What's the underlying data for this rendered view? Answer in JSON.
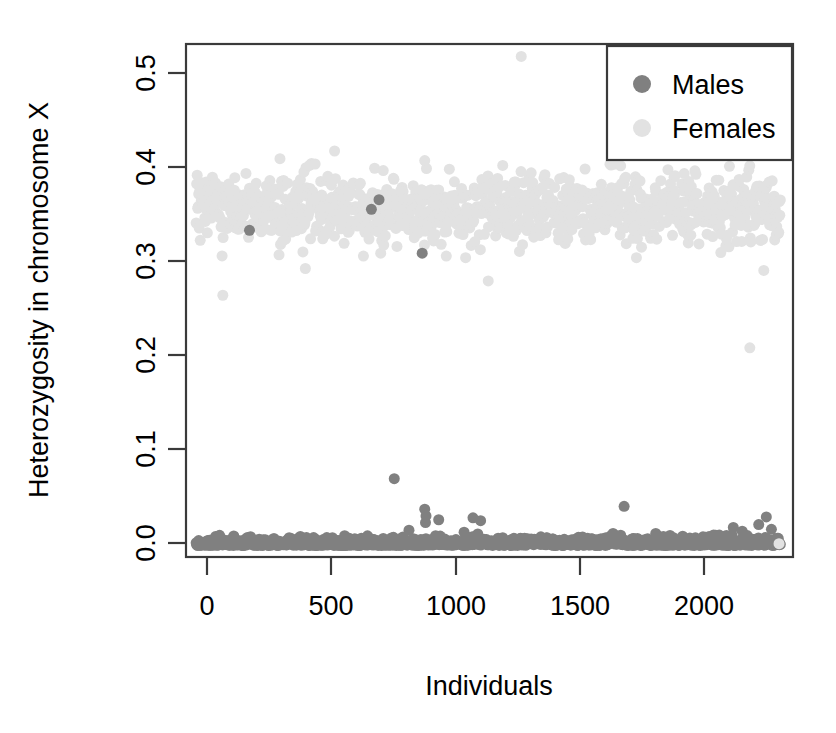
{
  "chart_data": {
    "type": "scatter",
    "title": "",
    "xlabel": "Individuals",
    "ylabel": "Heterozygosity in chromosome X",
    "xlim": [
      -40,
      2350
    ],
    "ylim": [
      -0.012,
      0.525
    ],
    "xticks": [
      0,
      500,
      1000,
      1500,
      2000
    ],
    "xtick_labels": [
      "0",
      "500",
      "1000",
      "1500",
      "2000"
    ],
    "yticks": [
      0.0,
      0.1,
      0.2,
      0.3,
      0.4,
      0.5
    ],
    "ytick_labels": [
      "0.0",
      "0.1",
      "0.2",
      "0.3",
      "0.4",
      "0.5"
    ],
    "grid": false,
    "legend_position": "top-right",
    "legend": [
      {
        "name": "Males",
        "color": "#808080"
      },
      {
        "name": "Females",
        "color": "#e2e2e2"
      }
    ],
    "series": [
      {
        "name": "Males",
        "color": "#808080",
        "marker": "circle",
        "marker_size": 11,
        "description": "Males cluster along heterozygosity ~0.000-0.008 across all individual indices, with scattered outliers up to 0.07 and three points inside the female band.",
        "baseline_count": 1150,
        "baseline_x_range": [
          0,
          2300
        ],
        "baseline_y_range": [
          0.0,
          0.009
        ],
        "outliers": [
          {
            "x": 780,
            "y": 0.07
          },
          {
            "x": 838,
            "y": 0.016
          },
          {
            "x": 900,
            "y": 0.038
          },
          {
            "x": 905,
            "y": 0.031
          },
          {
            "x": 903,
            "y": 0.024
          },
          {
            "x": 955,
            "y": 0.027
          },
          {
            "x": 1055,
            "y": 0.014
          },
          {
            "x": 1090,
            "y": 0.029
          },
          {
            "x": 1120,
            "y": 0.026
          },
          {
            "x": 1685,
            "y": 0.041
          },
          {
            "x": 2115,
            "y": 0.019
          },
          {
            "x": 2150,
            "y": 0.015
          },
          {
            "x": 2215,
            "y": 0.022
          },
          {
            "x": 2245,
            "y": 0.03
          },
          {
            "x": 2265,
            "y": 0.017
          },
          {
            "x": 210,
            "y": 0.33
          },
          {
            "x": 690,
            "y": 0.352
          },
          {
            "x": 720,
            "y": 0.362
          },
          {
            "x": 890,
            "y": 0.306
          }
        ]
      },
      {
        "name": "Females",
        "color": "#e2e2e2",
        "marker": "circle",
        "marker_size": 11,
        "description": "Females form a dense band centred on heterozygosity ~0.35 (range ~0.31-0.39) across all individual indices, with a few low outliers.",
        "band_count": 1150,
        "band_x_range": [
          0,
          2300
        ],
        "band_y_center": 0.352,
        "band_y_spread": 0.027,
        "outliers": [
          {
            "x": 1280,
            "y": 0.512
          },
          {
            "x": 330,
            "y": 0.405
          },
          {
            "x": 545,
            "y": 0.413
          },
          {
            "x": 900,
            "y": 0.403
          },
          {
            "x": 105,
            "y": 0.262
          },
          {
            "x": 430,
            "y": 0.29
          },
          {
            "x": 1150,
            "y": 0.277
          },
          {
            "x": 2235,
            "y": 0.288
          },
          {
            "x": 2180,
            "y": 0.207
          },
          {
            "x": 2295,
            "y": 0.002
          }
        ]
      }
    ]
  },
  "plot": {
    "frame_left_px": 186,
    "frame_right_px": 793,
    "frame_top_px": 44,
    "frame_bottom_px": 557
  },
  "legend_panel": {
    "males_label": "Males",
    "females_label": "Females"
  }
}
